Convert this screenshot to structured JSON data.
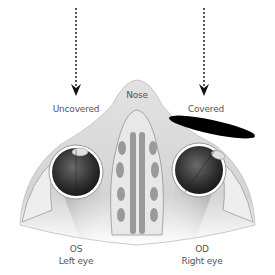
{
  "diagram": {
    "labels": {
      "uncovered": "Uncovered",
      "covered": "Covered",
      "nose": "Nose",
      "left_eye_code": "OS",
      "left_eye_name": "Left eye",
      "right_eye_code": "OD",
      "right_eye_name": "Right eye"
    },
    "arrows": [
      {
        "name": "uncovered-arrow",
        "direction": "down",
        "style": "dotted"
      },
      {
        "name": "covered-arrow",
        "direction": "down",
        "style": "dotted"
      }
    ],
    "occluder": {
      "color": "#000000",
      "shape": "ellipse"
    },
    "colors": {
      "background": "#ffffff",
      "tissue": "#d9d9d9",
      "sinus": "#9a9a9a",
      "eye": "#3a3a3a",
      "text": "#555555"
    }
  }
}
